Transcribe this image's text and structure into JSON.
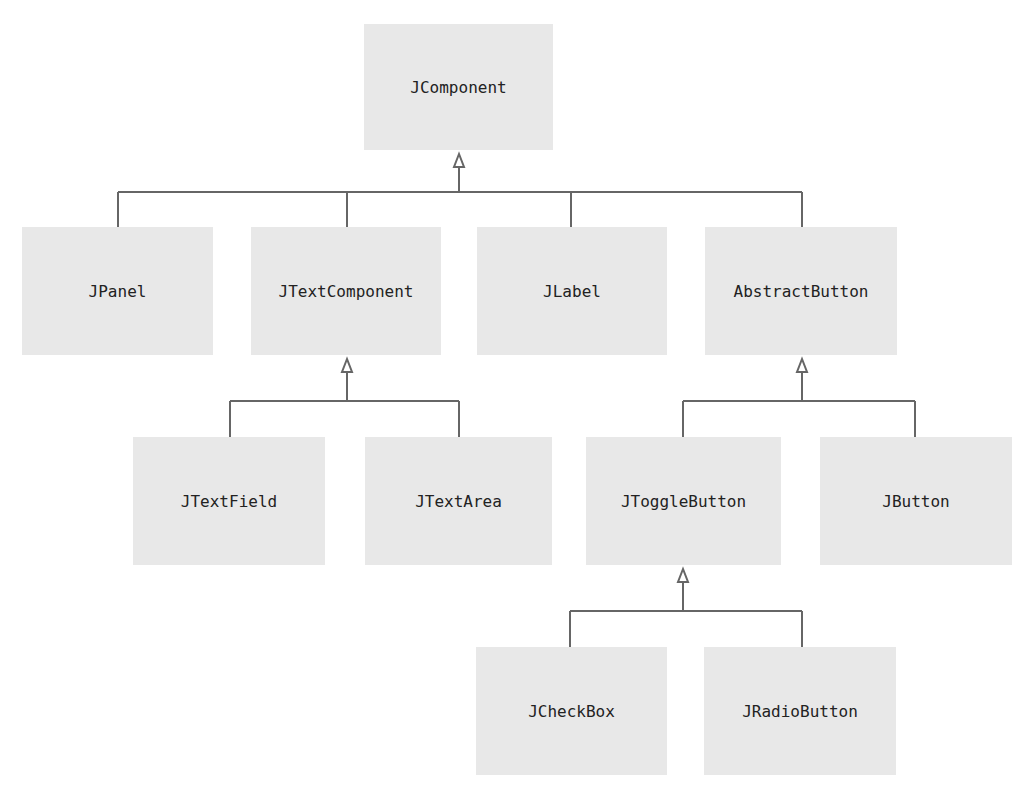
{
  "diagram": {
    "type": "class-hierarchy",
    "colors": {
      "box_fill": "#e8e8e8",
      "line": "#666666",
      "text": "#222222",
      "background": "#ffffff"
    },
    "nodes": {
      "jcomponent": "JComponent",
      "jpanel": "JPanel",
      "jtextcomponent": "JTextComponent",
      "jlabel": "JLabel",
      "abstractbutton": "AbstractButton",
      "jtextfield": "JTextField",
      "jtextarea": "JTextArea",
      "jtogglebutton": "JToggleButton",
      "jbutton": "JButton",
      "jcheckbox": "JCheckBox",
      "jradiobutton": "JRadioButton"
    },
    "edges": [
      {
        "from": "JPanel",
        "to": "JComponent",
        "kind": "inheritance"
      },
      {
        "from": "JTextComponent",
        "to": "JComponent",
        "kind": "inheritance"
      },
      {
        "from": "JLabel",
        "to": "JComponent",
        "kind": "inheritance"
      },
      {
        "from": "AbstractButton",
        "to": "JComponent",
        "kind": "inheritance"
      },
      {
        "from": "JTextField",
        "to": "JTextComponent",
        "kind": "inheritance"
      },
      {
        "from": "JTextArea",
        "to": "JTextComponent",
        "kind": "inheritance"
      },
      {
        "from": "JToggleButton",
        "to": "AbstractButton",
        "kind": "inheritance"
      },
      {
        "from": "JButton",
        "to": "AbstractButton",
        "kind": "inheritance"
      },
      {
        "from": "JCheckBox",
        "to": "JToggleButton",
        "kind": "inheritance"
      },
      {
        "from": "JRadioButton",
        "to": "JToggleButton",
        "kind": "inheritance"
      }
    ]
  }
}
